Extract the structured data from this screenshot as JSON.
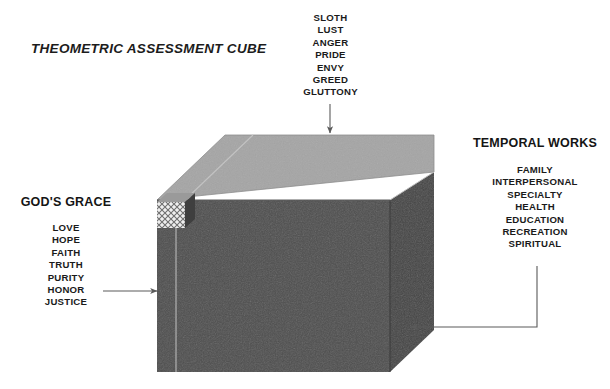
{
  "diagram": {
    "title": "THEOMETRIC ASSESSMENT CUBE",
    "type": "labeled 3D cube diagram",
    "colors": {
      "cube_top_face": "#a5a5a5",
      "cube_front_face": "#4e4e4e",
      "cube_side_face": "#454545",
      "cube_edge_line": "#b9b9b9",
      "arrow": "#5a5a5a",
      "text": "#1a1a1a",
      "background": "#ffffff"
    }
  },
  "axes": {
    "top": {
      "heading": "",
      "terms": [
        "SLOTH",
        "LUST",
        "ANGER",
        "PRIDE",
        "ENVY",
        "GREED",
        "GLUTTONY"
      ]
    },
    "right": {
      "heading": "TEMPORAL WORKS",
      "terms": [
        "FAMILY",
        "INTERPERSONAL",
        "SPECIALTY",
        "HEALTH",
        "EDUCATION",
        "RECREATION",
        "SPIRITUAL"
      ]
    },
    "left": {
      "heading": "GOD'S GRACE",
      "terms": [
        "LOVE",
        "HOPE",
        "FAITH",
        "TRUTH",
        "PURITY",
        "HONOR",
        "JUSTICE"
      ]
    }
  },
  "annotations": {
    "top_arrow": "down-arrow-icon",
    "left_arrow": "right-arrow-icon",
    "right_arrow": "left-arrow-icon",
    "highlighted_cell": "cross-hatched-unit-cube"
  }
}
